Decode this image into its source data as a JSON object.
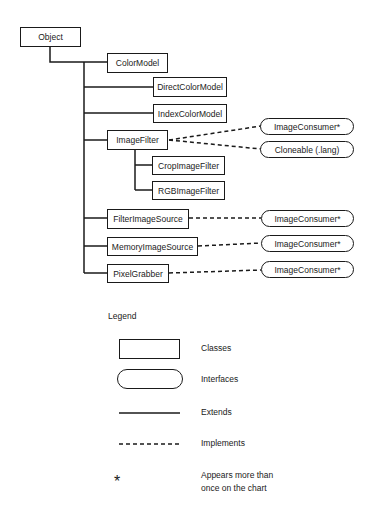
{
  "diagram": {
    "classes": {
      "object": "Object",
      "color_model": "ColorModel",
      "direct_color_model": "DirectColorModel",
      "index_color_model": "IndexColorModel",
      "image_filter": "ImageFilter",
      "crop_image_filter": "CropImageFilter",
      "rgb_image_filter": "RGBImageFilter",
      "filter_image_source": "FilterImageSource",
      "memory_image_source": "MemoryImageSource",
      "pixel_grabber": "PixelGrabber"
    },
    "interfaces": {
      "image_filter_consumer": "ImageConsumer*",
      "cloneable": "Cloneable (.lang)",
      "filter_image_source_consumer": "ImageConsumer*",
      "memory_image_source_consumer": "ImageConsumer*",
      "pixel_grabber_consumer": "ImageConsumer*"
    },
    "relations": [
      {
        "from": "ColorModel",
        "to": "Object",
        "type": "extends"
      },
      {
        "from": "DirectColorModel",
        "to": "Object",
        "type": "extends"
      },
      {
        "from": "IndexColorModel",
        "to": "Object",
        "type": "extends"
      },
      {
        "from": "ImageFilter",
        "to": "Object",
        "type": "extends"
      },
      {
        "from": "CropImageFilter",
        "to": "ImageFilter",
        "type": "extends"
      },
      {
        "from": "RGBImageFilter",
        "to": "ImageFilter",
        "type": "extends"
      },
      {
        "from": "FilterImageSource",
        "to": "Object",
        "type": "extends"
      },
      {
        "from": "MemoryImageSource",
        "to": "Object",
        "type": "extends"
      },
      {
        "from": "PixelGrabber",
        "to": "Object",
        "type": "extends"
      },
      {
        "from": "ImageFilter",
        "to": "ImageConsumer*",
        "type": "implements"
      },
      {
        "from": "ImageFilter",
        "to": "Cloneable (.lang)",
        "type": "implements"
      },
      {
        "from": "FilterImageSource",
        "to": "ImageConsumer*",
        "type": "implements"
      },
      {
        "from": "MemoryImageSource",
        "to": "ImageConsumer*",
        "type": "implements"
      },
      {
        "from": "PixelGrabber",
        "to": "ImageConsumer*",
        "type": "implements"
      }
    ]
  },
  "legend": {
    "title": "Legend",
    "classes": "Classes",
    "interfaces": "Interfaces",
    "extends": "Extends",
    "implements": "Implements",
    "star_symbol": "*",
    "star_line1": "Appears more than",
    "star_line2": "once on the chart"
  }
}
